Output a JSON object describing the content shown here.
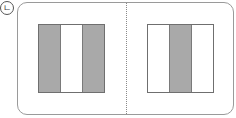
{
  "figure": {
    "label": "ㄴ",
    "colors": {
      "shaded": "#a9a9a9",
      "unshaded": "#ffffff",
      "border": "#6f6f6f",
      "frame": "#9a9a9a"
    },
    "panels": [
      {
        "name": "left",
        "stripes": [
          "shaded",
          "unshaded",
          "shaded"
        ]
      },
      {
        "name": "right",
        "stripes": [
          "unshaded",
          "shaded",
          "unshaded"
        ]
      }
    ]
  }
}
